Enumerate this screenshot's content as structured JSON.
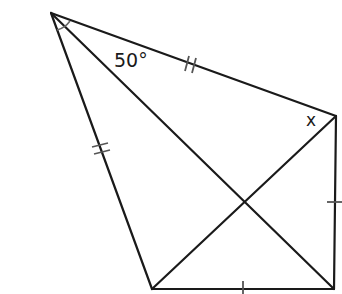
{
  "diagram": {
    "title": "",
    "labels": {
      "angle_at_top": "50°",
      "unknown_angle": "x"
    },
    "vertices": {
      "A": {
        "x": 51,
        "y": 13
      },
      "B": {
        "x": 336,
        "y": 116
      },
      "C": {
        "x": 334,
        "y": 289
      },
      "D": {
        "x": 152,
        "y": 289
      }
    },
    "segments": [
      {
        "from": "A",
        "to": "B",
        "marks": 2
      },
      {
        "from": "A",
        "to": "D",
        "marks": 2
      },
      {
        "from": "B",
        "to": "C",
        "marks": 1
      },
      {
        "from": "D",
        "to": "C",
        "marks": 1
      },
      {
        "from": "A",
        "to": "C",
        "marks": 0
      },
      {
        "from": "B",
        "to": "D",
        "marks": 0
      }
    ],
    "angle_marks": [
      {
        "vertex": "A",
        "between": [
          "AD",
          "AC"
        ],
        "type": "arc"
      }
    ],
    "colors": {
      "line": "#1a1a1a",
      "tick": "#555555",
      "background": "#ffffff"
    }
  }
}
